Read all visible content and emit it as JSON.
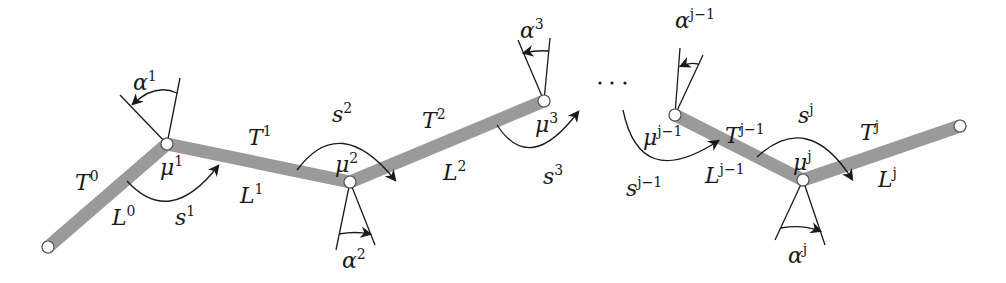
{
  "diagram": {
    "type": "kinematic-chain",
    "colors": {
      "link": "#9a9a9a",
      "stroke": "#1a1a1a",
      "joint_fill": "#ffffff",
      "background": "#ffffff"
    },
    "ellipsis": "...",
    "nodes": [
      {
        "id": "n0",
        "x": 48,
        "y": 247
      },
      {
        "id": "mu1",
        "x": 167,
        "y": 144
      },
      {
        "id": "mu2",
        "x": 350,
        "y": 182
      },
      {
        "id": "mu3",
        "x": 544,
        "y": 101
      },
      {
        "id": "muj-1",
        "x": 675,
        "y": 115
      },
      {
        "id": "muj",
        "x": 803,
        "y": 180
      },
      {
        "id": "nend",
        "x": 960,
        "y": 126
      }
    ],
    "labels": {
      "T0": {
        "base": "T",
        "sup": "0"
      },
      "L0": {
        "base": "L",
        "sup": "0"
      },
      "T1": {
        "base": "T",
        "sup": "1"
      },
      "L1": {
        "base": "L",
        "sup": "1"
      },
      "T2": {
        "base": "T",
        "sup": "2"
      },
      "L2": {
        "base": "L",
        "sup": "2"
      },
      "Tj-1": {
        "base": "T",
        "sup": "j−1"
      },
      "Lj-1": {
        "base": "L",
        "sup": "j−1"
      },
      "Tj": {
        "base": "T",
        "sup": "j"
      },
      "Lj": {
        "base": "L",
        "sup": "j"
      },
      "mu1": {
        "base": "μ",
        "sup": "1"
      },
      "mu2": {
        "base": "μ",
        "sup": "2"
      },
      "mu3": {
        "base": "μ",
        "sup": "3"
      },
      "muj-1": {
        "base": "μ",
        "sup": "j−1"
      },
      "muj": {
        "base": "μ",
        "sup": "j"
      },
      "s1": {
        "base": "s",
        "sup": "1"
      },
      "s2": {
        "base": "s",
        "sup": "2"
      },
      "s3": {
        "base": "s",
        "sup": "3"
      },
      "sj-1": {
        "base": "s",
        "sup": "j−1"
      },
      "sj": {
        "base": "s",
        "sup": "j"
      },
      "a1": {
        "base": "α",
        "sup": "1"
      },
      "a2": {
        "base": "α",
        "sup": "2"
      },
      "a3": {
        "base": "α",
        "sup": "3"
      },
      "aj-1": {
        "base": "α",
        "sup": "j−1"
      },
      "aj": {
        "base": "α",
        "sup": "j"
      }
    }
  }
}
